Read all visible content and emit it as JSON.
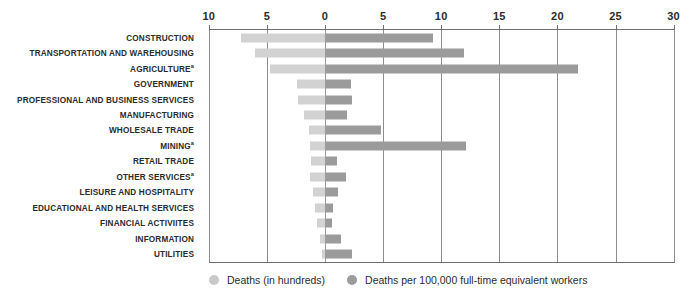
{
  "chart_data": {
    "type": "bar",
    "title": "",
    "subtitle": "",
    "xlabel": "",
    "ylabel": "",
    "orientation": "horizontal",
    "layout": "bidirectional-diverging",
    "grid": true,
    "legend_position": "bottom-left",
    "zero_value_label": "0",
    "left_axis": {
      "label": "Deaths (in hundreds)",
      "direction": "left",
      "ticks": [
        0,
        5,
        10
      ],
      "tick_labels": [
        "0",
        "5",
        "10"
      ],
      "range": [
        0,
        10
      ]
    },
    "right_axis": {
      "label": "Deaths per 100,000 full-time equivalent workers",
      "direction": "right",
      "ticks": [
        0,
        5,
        10,
        15,
        20,
        25,
        30
      ],
      "tick_labels": [
        "0",
        "5",
        "10",
        "15",
        "20",
        "25",
        "30"
      ],
      "range": [
        0,
        30
      ]
    },
    "axis_tick_labels_in_order": [
      "10",
      "5",
      "0",
      "5",
      "10",
      "15",
      "20",
      "25",
      "30"
    ],
    "categories": [
      "CONSTRUCTION",
      "TRANSPORTATION AND WAREHOUSING",
      "AGRICULTURE",
      "GOVERNMENT",
      "PROFESSIONAL AND BUSINESS SERVICES",
      "MANUFACTURING",
      "WHOLESALE TRADE",
      "MINING",
      "RETAIL TRADE",
      "OTHER SERVICES",
      "LEISURE AND HOSPITALITY",
      "EDUCATIONAL AND HEALTH SERVICES",
      "FINANCIAL ACTIVIITES",
      "INFORMATION",
      "UTILITIES"
    ],
    "category_footnotes": {
      "AGRICULTURE": "a",
      "MINING": "a",
      "OTHER SERVICES": "a"
    },
    "series": [
      {
        "name": "Deaths (in hundreds)",
        "side": "left",
        "color": "#d2d2d2",
        "values": [
          7.2,
          6.0,
          4.7,
          2.4,
          2.3,
          1.8,
          1.4,
          1.3,
          1.2,
          1.3,
          1.0,
          0.9,
          0.7,
          0.4,
          0.3
        ]
      },
      {
        "name": "Deaths per 100,000 full-time equivalent workers",
        "side": "right",
        "color": "#9b9b9b",
        "values": [
          9.3,
          12.0,
          21.8,
          2.2,
          2.3,
          1.9,
          4.8,
          12.1,
          1.0,
          1.8,
          1.1,
          0.7,
          0.6,
          1.4,
          2.3
        ]
      }
    ]
  },
  "legend": {
    "items": [
      {
        "label": "Deaths (in hundreds)",
        "swatch": "light-circle-swatch"
      },
      {
        "label": "Deaths per 100,000 full-time equivalent workers",
        "swatch": "dark-circle-swatch"
      }
    ]
  },
  "colors": {
    "bar_left": "#d2d2d2",
    "bar_right": "#9b9b9b",
    "gridline": "#8d8d8d",
    "axis_rule": "#6f6f6f",
    "text": "#2b2b2b",
    "background": "#ffffff"
  }
}
